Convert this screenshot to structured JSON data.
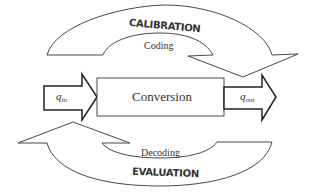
{
  "diagram": {
    "process_box": {
      "label": "Conversion"
    },
    "input_arrow": {
      "symbol": "q",
      "subscript": "in"
    },
    "output_arrow": {
      "symbol": "q",
      "subscript": "out"
    },
    "top_loop": {
      "title": "CALIBRATION",
      "inner_label": "Coding",
      "direction": "left-to-right"
    },
    "bottom_loop": {
      "title": "EVALUATION",
      "inner_label": "Decoding",
      "direction": "right-to-left"
    },
    "colors": {
      "stroke": "#333333",
      "background": "#ffffff",
      "text": "#333333"
    }
  }
}
